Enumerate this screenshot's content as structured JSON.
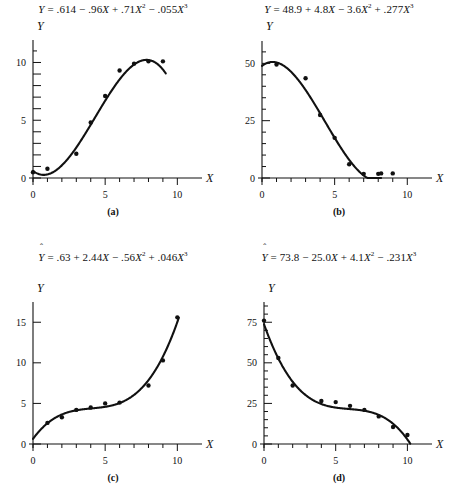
{
  "figure": {
    "title": "",
    "background": "#ffffff",
    "ink": "#111111"
  },
  "panels": [
    {
      "key": "a",
      "label": "(a)",
      "equation_text": "Ŷ = .614 − .96X + .71X² − .055X³",
      "axis_x_label": "X",
      "axis_y_label": "Y"
    },
    {
      "key": "b",
      "label": "(b)",
      "equation_text": "Ŷ = 48.9 + 4.8X − 3.6X² + .277X³",
      "axis_x_label": "X",
      "axis_y_label": "Y"
    },
    {
      "key": "c",
      "label": "(c)",
      "equation_text": "Ŷ = .63 + 2.44X − .56X² + .046X³",
      "axis_x_label": "X",
      "axis_y_label": "Y"
    },
    {
      "key": "d",
      "label": "(d)",
      "equation_text": "Ŷ = 73.8 − 25.0X + 4.1X² − .231X³",
      "axis_x_label": "X",
      "axis_y_label": "Y"
    }
  ],
  "chart_data": [
    {
      "type": "scatter",
      "panel": "a",
      "title": "Ŷ = .614 − .96X + .71X² − .055X³",
      "xlabel": "X",
      "ylabel": "Y",
      "xlim": [
        0,
        10.6
      ],
      "ylim": [
        0,
        11.6
      ],
      "xticks": [
        0,
        1,
        2,
        3,
        4,
        5,
        6,
        7,
        8,
        9,
        10
      ],
      "xticklabels": [
        "0",
        "",
        "",
        "",
        "",
        "5",
        "",
        "",
        "",
        "",
        "10"
      ],
      "yticks": [
        0,
        1,
        2,
        3,
        4,
        5,
        6,
        7,
        8,
        9,
        10
      ],
      "yticklabels": [
        "0",
        "",
        "",
        "",
        "",
        "5",
        "",
        "",
        "",
        "",
        "10"
      ],
      "grid": false,
      "legend": "none",
      "points": [
        {
          "x": 0.0,
          "y": 0.5
        },
        {
          "x": 1.0,
          "y": 0.8
        },
        {
          "x": 3.0,
          "y": 2.1
        },
        {
          "x": 4.0,
          "y": 4.8
        },
        {
          "x": 5.0,
          "y": 7.1
        },
        {
          "x": 6.0,
          "y": 9.3
        },
        {
          "x": 7.0,
          "y": 9.9
        },
        {
          "x": 8.0,
          "y": 10.1
        },
        {
          "x": 9.0,
          "y": 10.1
        }
      ],
      "fit": {
        "name": "cubic-fit",
        "coefficients": [
          0.614,
          -0.96,
          0.71,
          -0.055
        ],
        "x_range": [
          0.0,
          9.2
        ]
      }
    },
    {
      "type": "scatter",
      "panel": "b",
      "title": "Ŷ = 48.9 + 4.8X − 3.6X² + .277X³",
      "xlabel": "X",
      "ylabel": "Y",
      "xlim": [
        0,
        10.6
      ],
      "ylim": [
        0,
        58
      ],
      "xticks": [
        0,
        1,
        2,
        3,
        4,
        5,
        6,
        7,
        8,
        9,
        10
      ],
      "xticklabels": [
        "0",
        "",
        "",
        "",
        "",
        "5",
        "",
        "",
        "",
        "",
        "10"
      ],
      "yticks": [
        0,
        25,
        50
      ],
      "yticklabels": [
        "0",
        "25",
        "50"
      ],
      "grid": false,
      "legend": "none",
      "points": [
        {
          "x": 1.0,
          "y": 49.5
        },
        {
          "x": 3.0,
          "y": 43.5
        },
        {
          "x": 4.0,
          "y": 27.5
        },
        {
          "x": 5.0,
          "y": 17.5
        },
        {
          "x": 6.0,
          "y": 6.0
        },
        {
          "x": 7.0,
          "y": 1.8
        },
        {
          "x": 8.0,
          "y": 1.8
        },
        {
          "x": 8.2,
          "y": 2.0
        },
        {
          "x": 9.0,
          "y": 2.0
        }
      ],
      "fit": {
        "name": "cubic-fit",
        "coefficients": [
          48.9,
          4.8,
          -3.6,
          0.277
        ],
        "x_range": [
          0.0,
          8.2
        ]
      }
    },
    {
      "type": "scatter",
      "panel": "c",
      "title": "Ŷ = .63 + 2.44X − .56X² + .046X³",
      "xlabel": "X",
      "ylabel": "Y",
      "xlim": [
        0,
        10.6
      ],
      "ylim": [
        0,
        17
      ],
      "xticks": [
        0,
        1,
        2,
        3,
        4,
        5,
        6,
        7,
        8,
        9,
        10
      ],
      "xticklabels": [
        "0",
        "",
        "",
        "",
        "",
        "5",
        "",
        "",
        "",
        "",
        "10"
      ],
      "yticks": [
        0,
        5,
        10,
        15
      ],
      "yticklabels": [
        "0",
        "5",
        "10",
        "15"
      ],
      "grid": false,
      "legend": "none",
      "points": [
        {
          "x": 1.0,
          "y": 2.6
        },
        {
          "x": 2.0,
          "y": 3.3
        },
        {
          "x": 3.0,
          "y": 4.2
        },
        {
          "x": 4.0,
          "y": 4.5
        },
        {
          "x": 5.0,
          "y": 5.0
        },
        {
          "x": 6.0,
          "y": 5.1
        },
        {
          "x": 8.0,
          "y": 7.2
        },
        {
          "x": 9.0,
          "y": 10.3
        },
        {
          "x": 10.0,
          "y": 15.6
        }
      ],
      "fit": {
        "name": "cubic-fit",
        "coefficients": [
          0.63,
          2.44,
          -0.56,
          0.046
        ],
        "x_range": [
          0.0,
          10.1
        ]
      }
    },
    {
      "type": "scatter",
      "panel": "d",
      "title": "Ŷ = 73.8 − 25.0X + 4.1X² − .231X³",
      "xlabel": "X",
      "ylabel": "Y",
      "xlim": [
        0,
        10.6
      ],
      "ylim": [
        0,
        85
      ],
      "xticks": [
        0,
        1,
        2,
        3,
        4,
        5,
        6,
        7,
        8,
        9,
        10
      ],
      "xticklabels": [
        "0",
        "",
        "",
        "",
        "",
        "5",
        "",
        "",
        "",
        "",
        "10"
      ],
      "yticks": [
        0,
        25,
        50,
        75
      ],
      "yticklabels": [
        "0",
        "25",
        "50",
        "75"
      ],
      "grid": false,
      "legend": "none",
      "points": [
        {
          "x": 0.0,
          "y": 76.0
        },
        {
          "x": 1.0,
          "y": 53.0
        },
        {
          "x": 2.0,
          "y": 36.0
        },
        {
          "x": 4.0,
          "y": 26.5
        },
        {
          "x": 5.0,
          "y": 25.8
        },
        {
          "x": 6.0,
          "y": 23.5
        },
        {
          "x": 7.0,
          "y": 21.0
        },
        {
          "x": 8.0,
          "y": 17.0
        },
        {
          "x": 9.0,
          "y": 10.5
        },
        {
          "x": 10.0,
          "y": 5.5
        }
      ],
      "fit": {
        "name": "cubic-fit",
        "coefficients": [
          73.8,
          -25.0,
          4.1,
          -0.231
        ],
        "x_range": [
          0.0,
          10.2
        ]
      }
    }
  ]
}
